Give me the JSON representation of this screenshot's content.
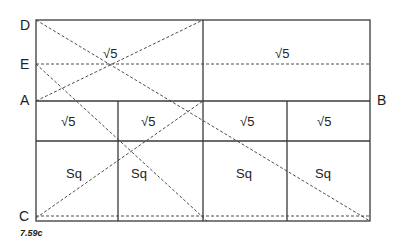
{
  "figure": {
    "caption": "7.59c",
    "points": {
      "D": "D",
      "E": "E",
      "A": "A",
      "B": "B",
      "C": "C"
    },
    "cells": {
      "top_left": "√5",
      "top_right": "√5",
      "row2": [
        "√5",
        "√5",
        "√5",
        "√5"
      ],
      "row3": [
        "Sq",
        "Sq",
        "Sq",
        "Sq"
      ]
    }
  }
}
